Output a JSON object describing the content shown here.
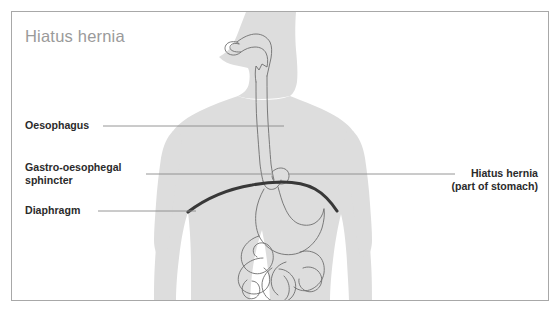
{
  "figure": {
    "title": "Hiatus hernia",
    "frame": {
      "border_color": "#a8a8a8",
      "background_color": "#ffffff"
    },
    "colors": {
      "body_silhouette": "#dddddd",
      "organ_outline": "#6e6e6e",
      "diaphragm": "#383838",
      "leader_line": "#8a8a8a",
      "title_text": "#9a9a9a",
      "label_text": "#2b2b2b"
    }
  },
  "labels": {
    "oesophagus": {
      "text": "Oesophagus"
    },
    "sphincter": {
      "line1": "Gastro-oesophegal",
      "line2": "sphincter"
    },
    "diaphragm": {
      "text": "Diaphragm"
    },
    "hernia": {
      "line1": "Hiatus hernia",
      "line2": "(part of stomach)"
    }
  },
  "anatomy": {
    "parts": [
      "head-profile",
      "torso-silhouette",
      "oesophagus",
      "gastro-oesophageal-sphincter",
      "hiatus-hernia-bulge",
      "diaphragm",
      "stomach",
      "duodenum",
      "small-intestine",
      "large-intestine"
    ]
  }
}
